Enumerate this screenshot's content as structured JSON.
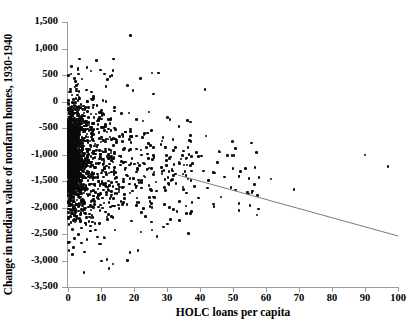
{
  "chart_data": {
    "type": "scatter",
    "title": "",
    "xlabel": "HOLC loans per capita",
    "ylabel": "Change in median value of nonfarm homes, 1930-1940",
    "xlim": [
      0,
      100
    ],
    "ylim": [
      -3500,
      1500
    ],
    "xticks": [
      0,
      10,
      20,
      30,
      40,
      50,
      60,
      70,
      80,
      90,
      100
    ],
    "xtick_labels": [
      "0",
      "10",
      "20",
      "30",
      "40",
      "50",
      "60",
      "70",
      "80",
      "90",
      "100"
    ],
    "yticks": [
      1500,
      1000,
      500,
      0,
      -500,
      -1000,
      -1500,
      -2000,
      -2500,
      -3000,
      -3500
    ],
    "ytick_labels": [
      "1,500",
      "1,000",
      "500",
      "0",
      "-500",
      "-1,000",
      "-1,500",
      "-2,000",
      "-2,500",
      "-3,000",
      "-3,500"
    ],
    "grid": false,
    "legend": null,
    "marker_color": "#0a0a0a",
    "axis_color": "#9a9a9a",
    "trendline": {
      "type": "linear",
      "x_start": 33.3,
      "y_start": -1388,
      "x_end": 100.0,
      "y_end": -2537,
      "color": "#7a7a7a"
    },
    "n_points_approx": 1700,
    "notable_points": [
      {
        "x": 19.0,
        "y": 1250
      },
      {
        "x": 3.5,
        "y": 800
      },
      {
        "x": 3.0,
        "y": 600
      },
      {
        "x": 3.2,
        "y": 520
      },
      {
        "x": 11.0,
        "y": 520
      },
      {
        "x": 25.5,
        "y": 540
      },
      {
        "x": 27.5,
        "y": 540
      },
      {
        "x": 22.0,
        "y": 430
      },
      {
        "x": 18.0,
        "y": 300
      },
      {
        "x": 41.5,
        "y": 230
      },
      {
        "x": 90.0,
        "y": -1010
      },
      {
        "x": 97.0,
        "y": -1230
      },
      {
        "x": 68.5,
        "y": -1660
      },
      {
        "x": 61.5,
        "y": -1460
      },
      {
        "x": 57.5,
        "y": -1770
      },
      {
        "x": 36.5,
        "y": -2490
      },
      {
        "x": 4.8,
        "y": -3230
      },
      {
        "x": 0.3,
        "y": -2810
      },
      {
        "x": 1.7,
        "y": -2760
      },
      {
        "x": 33.0,
        "y": -2080
      }
    ]
  }
}
